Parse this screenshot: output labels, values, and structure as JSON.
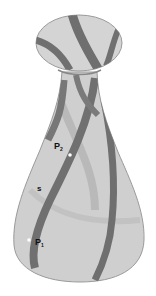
{
  "figure": {
    "colors": {
      "surface": "#cfcfcf",
      "surface_edge": "#9a9a9a",
      "stripe": "#6f6f6f",
      "stripe_faint": "#b4b4b4",
      "point": "#ffffff",
      "label": "#111111"
    },
    "labels": {
      "p2": {
        "main": "P",
        "sub": "2"
      },
      "s": "s",
      "p1": {
        "main": "P",
        "sub": "1"
      }
    }
  }
}
